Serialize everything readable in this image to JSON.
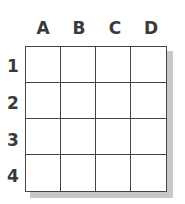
{
  "grid": {
    "columns": [
      "A",
      "B",
      "C",
      "D"
    ],
    "rows": [
      "1",
      "2",
      "3",
      "4"
    ],
    "cells": [
      [
        "",
        "",
        "",
        ""
      ],
      [
        "",
        "",
        "",
        ""
      ],
      [
        "",
        "",
        "",
        ""
      ],
      [
        "",
        "",
        "",
        ""
      ]
    ]
  }
}
